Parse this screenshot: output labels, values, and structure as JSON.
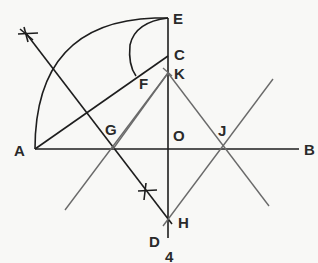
{
  "diagram": {
    "labels": {
      "E": "E",
      "C": "C",
      "K": "K",
      "F": "F",
      "A": "A",
      "G": "G",
      "O": "O",
      "J": "J",
      "B": "B",
      "H": "H",
      "D": "D",
      "figure_number": "4"
    },
    "colors": {
      "primary_line": "#1e1e1e",
      "secondary_line": "#6a6a6a",
      "background": "#f8f8f6"
    }
  }
}
